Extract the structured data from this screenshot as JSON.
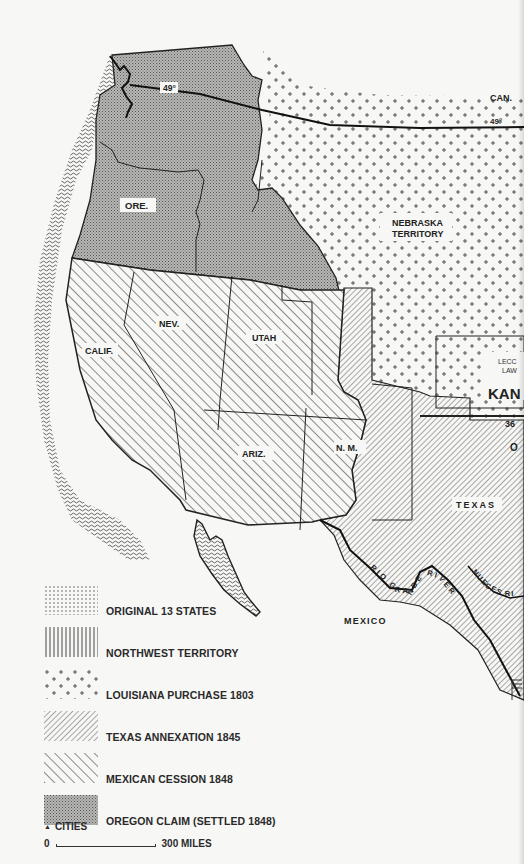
{
  "map": {
    "title": "Westward expansion territorial acquisitions",
    "labels": {
      "parallel_49_left": "49°",
      "parallel_49_right": "49°",
      "canada": "CAN.",
      "nebraska_line1": "NEBRASKA",
      "nebraska_line2": "TERRITORY",
      "oregon": "ORE.",
      "nevada": "NEV.",
      "utah": "UTAH",
      "california": "CALIF.",
      "arizona": "ARIZ.",
      "new_mexico": "N. M.",
      "texas": "TEXAS",
      "kansas_partial": "KAN",
      "lecompton_line1": "LECC",
      "lecompton_line2": "LAW",
      "parallel_36": "36",
      "oklahoma_partial": "O",
      "mexico": "MEXICO",
      "rio_grande": "RIO GRANDE RIVER",
      "nueces": "NUECES RI"
    }
  },
  "legend": {
    "items": [
      {
        "pattern": "dots-grid",
        "label": "ORIGINAL 13 STATES"
      },
      {
        "pattern": "vertical-lines",
        "label": "NORTHWEST TERRITORY"
      },
      {
        "pattern": "plus-signs",
        "label": "LOUISIANA PURCHASE 1803"
      },
      {
        "pattern": "diagonal-back-dense",
        "label": "TEXAS ANNEXATION 1845"
      },
      {
        "pattern": "diagonal-forward",
        "label": "MEXICAN CESSION 1848"
      },
      {
        "pattern": "stipple-gray",
        "label": "OREGON CLAIM (SETTLED 1848)"
      }
    ],
    "cities_symbol": "▲",
    "cities_label": "CITIES",
    "scale_start": "0",
    "scale_end": "300 MILES"
  },
  "colors": {
    "paper": "#f7f7f5",
    "ink": "#222222",
    "oregon_fill": "#a9a9a6",
    "ocean_wave": "#9a9a98"
  }
}
